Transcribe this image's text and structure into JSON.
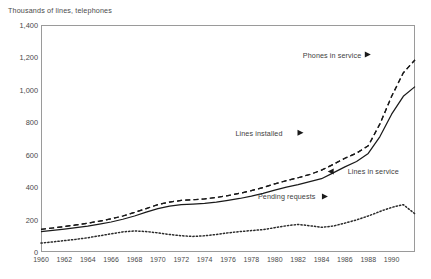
{
  "chart_data": {
    "type": "line",
    "title": "Thousands of lines, telephones",
    "xlabel": "",
    "ylabel": "Thousands of lines, telephones",
    "xlim": [
      1960,
      1992
    ],
    "ylim": [
      0,
      1400
    ],
    "ytick_step": 200,
    "xtick_step": 2,
    "grid": false,
    "legend_position": "inline-annotations",
    "ytick_labels": [
      "0",
      "200",
      "400",
      "600",
      "800",
      "1,000",
      "1,200",
      "1,400"
    ],
    "ytick_values": [
      0,
      200,
      400,
      600,
      800,
      1000,
      1200,
      1400
    ],
    "xtick_labels": [
      "1960",
      "1962",
      "1964",
      "1966",
      "1968",
      "1970",
      "1972",
      "1974",
      "1976",
      "1978",
      "1980",
      "1982",
      "1984",
      "1986",
      "1988",
      "1990"
    ],
    "xtick_values": [
      1960,
      1962,
      1964,
      1966,
      1968,
      1970,
      1972,
      1974,
      1976,
      1978,
      1980,
      1982,
      1984,
      1986,
      1988,
      1990
    ],
    "x": [
      1960,
      1961,
      1962,
      1963,
      1964,
      1965,
      1966,
      1967,
      1968,
      1969,
      1970,
      1971,
      1972,
      1973,
      1974,
      1975,
      1976,
      1977,
      1978,
      1979,
      1980,
      1981,
      1982,
      1983,
      1984,
      1985,
      1986,
      1987,
      1988,
      1989,
      1990,
      1991,
      1992
    ],
    "series": [
      {
        "name": "Phones in service",
        "style": "dashed",
        "color": "#1a1a1a",
        "values": [
          140,
          148,
          157,
          167,
          178,
          190,
          204,
          222,
          244,
          268,
          292,
          308,
          318,
          322,
          328,
          336,
          348,
          362,
          378,
          398,
          420,
          440,
          458,
          478,
          505,
          540,
          578,
          610,
          655,
          790,
          960,
          1105,
          1185
        ]
      },
      {
        "name": "Lines installed",
        "style": "dashed",
        "color": "#1a1a1a",
        "values": [
          140,
          148,
          157,
          167,
          178,
          190,
          204,
          222,
          244,
          268,
          292,
          308,
          318,
          322,
          328,
          336,
          348,
          362,
          378,
          398,
          420,
          440,
          458,
          478,
          505,
          540,
          578,
          610,
          655,
          790,
          960,
          1105,
          1185
        ]
      },
      {
        "name": "Lines in service",
        "style": "solid",
        "color": "#1a1a1a",
        "values": [
          125,
          133,
          141,
          150,
          160,
          172,
          185,
          202,
          222,
          246,
          268,
          283,
          292,
          296,
          300,
          307,
          318,
          330,
          344,
          362,
          382,
          400,
          416,
          434,
          452,
          488,
          525,
          558,
          608,
          712,
          850,
          960,
          1020
        ]
      },
      {
        "name": "Pending requests",
        "style": "dotted",
        "color": "#2b2b2b",
        "values": [
          55,
          62,
          70,
          78,
          88,
          100,
          112,
          124,
          130,
          126,
          118,
          108,
          100,
          96,
          100,
          108,
          118,
          126,
          132,
          138,
          150,
          162,
          170,
          162,
          152,
          160,
          178,
          198,
          222,
          250,
          275,
          292,
          235
        ]
      }
    ],
    "annotations": [
      {
        "text": "Phones in service",
        "marker": "left-arrow",
        "x_frac": 0.7,
        "y_frac": 0.13
      },
      {
        "text": "Lines installed",
        "marker": "left-arrow",
        "x_frac": 0.52,
        "y_frac": 0.475
      },
      {
        "text": "Lines in service",
        "marker": "left-arrow",
        "x_frac": 0.82,
        "y_frac": 0.645
      },
      {
        "text": "Pending requests",
        "marker": "left-arrow",
        "x_frac": 0.58,
        "y_frac": 0.755
      }
    ]
  },
  "annotation_labels": {
    "phones_in_service": "Phones in service",
    "lines_installed": "Lines installed",
    "lines_in_service": "Lines in service",
    "pending_requests": "Pending requests"
  }
}
